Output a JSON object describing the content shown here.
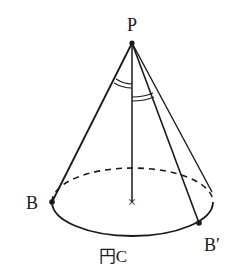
{
  "diagram": {
    "type": "cone",
    "labels": {
      "apex": "P",
      "point_b": "B",
      "point_b_prime": "B′",
      "circle": "円C"
    },
    "marks": {
      "center": "×"
    },
    "colors": {
      "stroke": "#1a1a1a",
      "background": "#ffffff"
    }
  }
}
